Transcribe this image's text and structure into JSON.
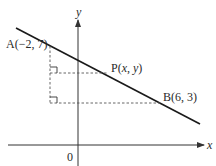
{
  "diagram": {
    "type": "coordinate-geometry",
    "axes": {
      "x_label": "x",
      "y_label": "y",
      "origin_label": "0"
    },
    "points": {
      "A": {
        "label": "A(−2, 7)",
        "x": -2,
        "y": 7
      },
      "B": {
        "label": "B(6, 3)",
        "x": 6,
        "y": 3
      },
      "P": {
        "label_prefix": "P(",
        "var_x": "x",
        "sep": ", ",
        "var_y": "y",
        "label_suffix": ")"
      }
    },
    "colors": {
      "line": "#1a1a1a",
      "axis": "#333333",
      "dashed": "#555555",
      "text": "#2a2a2a"
    }
  }
}
